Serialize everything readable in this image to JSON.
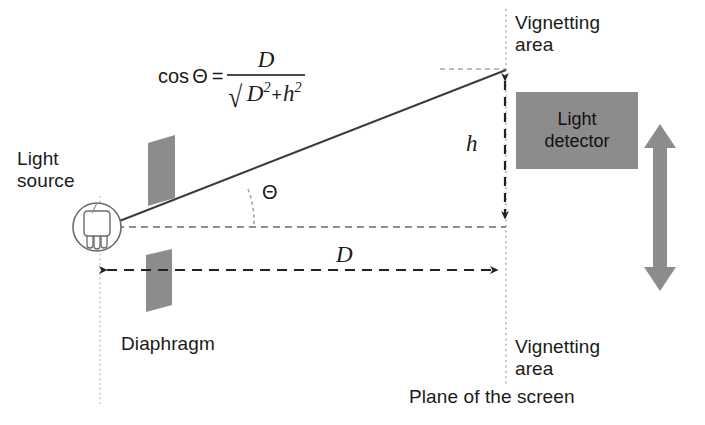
{
  "figure": {
    "background_color": "#ffffff"
  },
  "formula": {
    "lhs": "cos",
    "theta_symbol": "Θ",
    "equals": "=",
    "numerator": "D",
    "radical_symbol": "√",
    "denominator_terms": [
      "D",
      "h"
    ],
    "denominator_text": "D² + h²",
    "plus": "+",
    "exponent": "2",
    "full_text": "cos Θ = D / √(D² + h²)"
  },
  "labels": {
    "light_source": "Light\nsource",
    "light_source_line1": "Light",
    "light_source_line2": "source",
    "diaphragm": "Diaphragm",
    "detector_line1": "Light",
    "detector_line2": "detector",
    "vignetting_top_line1": "Vignetting",
    "vignetting_top_line2": "area",
    "vignetting_bottom_line1": "Vignetting",
    "vignetting_bottom_line2": "area",
    "plane_of_screen": "Plane of the screen",
    "distance_D": "D",
    "height_h": "h",
    "angle_theta": "Θ"
  },
  "colors": {
    "diaphragm_fill": "#8c8c8c",
    "detector_fill": "#8c8c8c",
    "detector_text": "#111111",
    "travel_arrow_fill": "#8c8c8c",
    "ray_line": "#3c3c3c",
    "dimension_line": "#222222",
    "reference_line": "#bfbfbf",
    "arc_line": "#9a9a9a",
    "text": "#1a1a1a",
    "bulb_outline": "#6b6b6b"
  },
  "geometry": {
    "source_center_x": 97,
    "source_center_y": 227,
    "source_radius": 24,
    "screen_plane_x": 506,
    "source_plane_x": 100,
    "optical_axis_y": 227,
    "ray_hit_y": 73,
    "detector_box": {
      "x": 516,
      "y": 92,
      "w": 122,
      "h": 77
    },
    "dimension_D_y": 270,
    "dimension_h_x": 505,
    "travel_arrow_x": 660,
    "travel_arrow_top": 125,
    "travel_arrow_bottom": 290
  },
  "icons": {
    "light_bulb": "light-bulb-icon",
    "travel_arrow": "double-arrow-vertical-icon",
    "dimension_arrow_h": "dimension-arrow-vertical-icon",
    "dimension_arrow_d": "dimension-arrow-horizontal-icon"
  }
}
